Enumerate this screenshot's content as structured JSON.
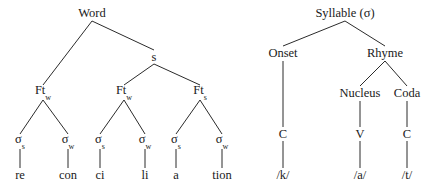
{
  "figure": {
    "background_color": "#ffffff",
    "line_color": "#2b2b2b",
    "text_color": "#1a1a1a"
  },
  "word_tree": {
    "name": "prosodic-word-tree",
    "nodes": {
      "root": "Word",
      "s_node": "s",
      "foot1": "Ft",
      "foot1_sub": "w",
      "foot2": "Ft",
      "foot2_sub": "w",
      "foot3": "Ft",
      "foot3_sub": "s",
      "sigma": "σ",
      "sigma1_sub": "s",
      "sigma2_sub": "w",
      "sigma3_sub": "s",
      "sigma4_sub": "w",
      "sigma5_sub": "s",
      "sigma6_sub": "w"
    },
    "leaves": [
      "re",
      "con",
      "ci",
      "li",
      "a",
      "tion"
    ]
  },
  "syllable_tree": {
    "name": "syllable-structure-tree",
    "nodes": {
      "root": "Syllable (σ)",
      "onset": "Onset",
      "rhyme": "Rhyme",
      "nucleus": "Nucleus",
      "coda": "Coda",
      "onset_slot": "C",
      "nucleus_slot": "V",
      "coda_slot": "C"
    },
    "leaves": {
      "onset_segment": "/k/",
      "nucleus_segment": "/a/",
      "coda_segment": "/t/"
    }
  }
}
